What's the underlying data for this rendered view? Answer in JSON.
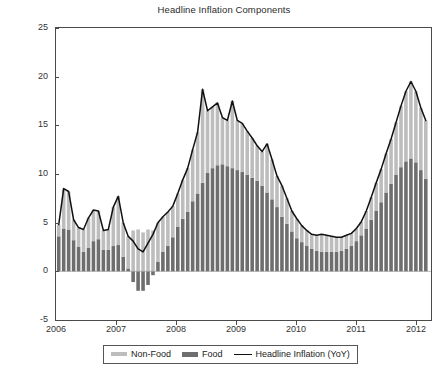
{
  "chart_data": {
    "type": "bar",
    "title": "Headline Inflation Components",
    "xlabel": "",
    "ylabel": "",
    "ylim": [
      -5,
      25
    ],
    "ytick_labels": [
      "25",
      "20",
      "15",
      "10",
      "5",
      "0",
      "-5"
    ],
    "ytick_values": [
      25,
      20,
      15,
      10,
      5,
      0,
      -5
    ],
    "xtick_labels": [
      "2006",
      "2007",
      "2008",
      "2009",
      "2010",
      "2011",
      "2012"
    ],
    "xtick_values": [
      2006,
      2007,
      2008,
      2009,
      2010,
      2011,
      2012
    ],
    "xlim": [
      2006.0,
      2012.25
    ],
    "grid": false,
    "stacked": true,
    "legend_position": "below-axes",
    "colors": {
      "non_food": "#bdbdbd",
      "food": "#6e6e6e",
      "headline_line": "#111111",
      "axis": "#4a4a4a",
      "text": "#2b2b2b",
      "background": "#ffffff"
    },
    "legend": [
      {
        "label": "Non-Food",
        "marker": "bar-swatch-light"
      },
      {
        "label": "Food",
        "marker": "bar-swatch-dark"
      },
      {
        "label": "Headline Inflation (YoY)",
        "marker": "line-swatch-black"
      }
    ],
    "x": [
      "2006-01",
      "2006-02",
      "2006-03",
      "2006-04",
      "2006-05",
      "2006-06",
      "2006-07",
      "2006-08",
      "2006-09",
      "2006-10",
      "2006-11",
      "2006-12",
      "2007-01",
      "2007-02",
      "2007-03",
      "2007-04",
      "2007-05",
      "2007-06",
      "2007-07",
      "2007-08",
      "2007-09",
      "2007-10",
      "2007-11",
      "2007-12",
      "2008-01",
      "2008-02",
      "2008-03",
      "2008-04",
      "2008-05",
      "2008-06",
      "2008-07",
      "2008-08",
      "2008-09",
      "2008-10",
      "2008-11",
      "2008-12",
      "2009-01",
      "2009-02",
      "2009-03",
      "2009-04",
      "2009-05",
      "2009-06",
      "2009-07",
      "2009-08",
      "2009-09",
      "2009-10",
      "2009-11",
      "2009-12",
      "2010-01",
      "2010-02",
      "2010-03",
      "2010-04",
      "2010-05",
      "2010-06",
      "2010-07",
      "2010-08",
      "2010-09",
      "2010-10",
      "2010-11",
      "2010-12",
      "2011-01",
      "2011-02",
      "2011-03",
      "2011-04",
      "2011-05",
      "2011-06",
      "2011-07",
      "2011-08",
      "2011-09",
      "2011-10",
      "2011-11",
      "2011-12",
      "2012-01",
      "2012-02",
      "2012-03"
    ],
    "series": [
      {
        "name": "Food",
        "stack_order": 1,
        "values": [
          3.6,
          4.4,
          4.3,
          3.2,
          2.5,
          2.0,
          2.4,
          3.1,
          3.3,
          2.2,
          2.2,
          2.6,
          2.7,
          1.5,
          0.3,
          -1.1,
          -2.0,
          -2.0,
          -1.4,
          -0.4,
          1.0,
          2.0,
          2.6,
          3.5,
          4.6,
          5.4,
          6.1,
          7.2,
          8.0,
          9.1,
          10.1,
          10.6,
          10.9,
          11.0,
          10.8,
          10.6,
          10.4,
          10.2,
          9.9,
          9.6,
          9.3,
          8.8,
          8.1,
          7.4,
          6.6,
          5.6,
          4.9,
          4.1,
          3.4,
          3.0,
          2.6,
          2.3,
          2.1,
          2.0,
          2.0,
          2.0,
          2.0,
          2.1,
          2.3,
          2.6,
          3.1,
          3.7,
          4.4,
          5.3,
          6.2,
          7.1,
          8.1,
          9.0,
          9.9,
          10.7,
          11.3,
          11.6,
          11.2,
          10.4,
          9.5
        ]
      },
      {
        "name": "Non-Food",
        "stack_order": 2,
        "values": [
          1.2,
          4.1,
          3.9,
          2.1,
          2.0,
          2.3,
          3.1,
          3.2,
          2.9,
          2.0,
          2.1,
          4.0,
          5.0,
          3.5,
          3.3,
          4.2,
          4.3,
          4.0,
          4.3,
          4.2,
          4.0,
          3.6,
          3.5,
          3.2,
          3.4,
          4.0,
          4.5,
          5.3,
          6.3,
          9.6,
          6.4,
          6.3,
          6.4,
          4.8,
          4.7,
          6.9,
          5.1,
          5.0,
          4.5,
          4.1,
          3.6,
          3.5,
          5.0,
          4.1,
          3.2,
          3.2,
          2.6,
          2.1,
          2.0,
          1.7,
          1.6,
          1.5,
          1.6,
          1.8,
          1.7,
          1.6,
          1.5,
          1.4,
          1.4,
          1.3,
          1.3,
          1.4,
          1.8,
          2.3,
          2.9,
          3.4,
          4.0,
          4.6,
          5.4,
          6.3,
          7.2,
          7.9,
          7.3,
          6.4,
          6.0
        ]
      }
    ],
    "line_series": {
      "name": "Headline Inflation (YoY)",
      "values": [
        4.8,
        8.5,
        8.2,
        5.3,
        4.5,
        4.3,
        5.5,
        6.3,
        6.2,
        4.2,
        4.3,
        6.6,
        7.7,
        5.0,
        3.6,
        3.1,
        2.3,
        2.0,
        2.9,
        3.8,
        5.0,
        5.6,
        6.1,
        6.7,
        8.0,
        9.4,
        10.6,
        12.5,
        14.3,
        18.7,
        16.5,
        16.9,
        17.3,
        15.8,
        15.5,
        17.5,
        15.5,
        15.2,
        14.4,
        13.7,
        12.9,
        12.3,
        13.1,
        11.5,
        9.8,
        8.8,
        7.5,
        6.2,
        5.4,
        4.7,
        4.2,
        3.8,
        3.7,
        3.8,
        3.7,
        3.6,
        3.5,
        3.5,
        3.7,
        3.9,
        4.4,
        5.1,
        6.2,
        7.6,
        9.1,
        10.5,
        12.1,
        13.6,
        15.3,
        17.0,
        18.5,
        19.5,
        18.5,
        16.8,
        15.5
      ]
    }
  }
}
